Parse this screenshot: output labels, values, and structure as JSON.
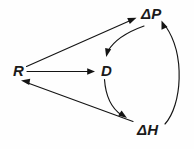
{
  "figure": {
    "type": "path-diagram",
    "background_color": "#fefefe",
    "line_color": "#141414",
    "text_color": "#1a1a1a",
    "width": 194,
    "height": 149
  },
  "nodes": [
    {
      "id": "R",
      "label": "R",
      "x": 13,
      "y": 63
    },
    {
      "id": "D",
      "label": "D",
      "x": 101,
      "y": 63
    },
    {
      "id": "dP",
      "label": "ΔP",
      "x": 141,
      "y": 6
    },
    {
      "id": "dH",
      "label": "ΔH",
      "x": 137,
      "y": 122
    }
  ],
  "edges": [
    {
      "id": "r-to-dp",
      "from": "R",
      "to": "ΔP",
      "style": "straight",
      "arrow_at": "ΔP"
    },
    {
      "id": "r-to-d",
      "from": "R",
      "to": "D",
      "style": "straight",
      "arrow_at": "D"
    },
    {
      "id": "dh-to-r",
      "from": "ΔH",
      "to": "R",
      "style": "straight",
      "arrow_at": "R"
    },
    {
      "id": "dp-to-d",
      "from": "ΔP",
      "to": "D",
      "style": "curved",
      "arrow_at": "D"
    },
    {
      "id": "d-to-dh",
      "from": "D",
      "to": "ΔH",
      "style": "curved",
      "arrow_at": "ΔH"
    },
    {
      "id": "dh-to-dp",
      "from": "ΔH",
      "to": "ΔP",
      "style": "curved",
      "arrow_at": "ΔP"
    }
  ]
}
